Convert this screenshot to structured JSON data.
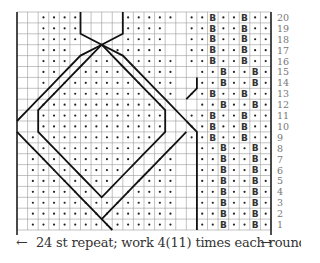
{
  "chart_data": {
    "type": "table",
    "columns": 24,
    "rows": 20,
    "row_labels": [
      "1",
      "2",
      "3",
      "4",
      "5",
      "6",
      "7",
      "8",
      "9",
      "10",
      "11",
      "12",
      "13",
      "14",
      "15",
      "16",
      "17",
      "18",
      "19",
      "20"
    ],
    "legend_symbols": {
      ".": "purl (dot)",
      "B": "knit through back loop",
      "_": "knit (blank)",
      "/": "cable cross stitch marker"
    },
    "grid_top_to_bottom": [
      "__....____....._..B..B..",
      "__....____....__..B..B..",
      "__....____....__..B..B..",
      "__.../__\\.....__..B..B..",
      "__...//..\\\\...._..B..B..",
      "__..//....\\\\...__..B..B..",
      "__./........\\..__..B..B..",
      "__/..........\\._..B..B..",
      "_/............\\__..B..B..",
      "__............__..B..B..",
      "__............__..B..B..",
      "_.\\..........//_..B..B..",
      "_..\\........//.__..B..B..",
      "_...\\......//..__..B..B..",
      "_....\\....//...__..B..B..",
      "_.....\\..//....__..B..B..",
      "_......\\//.....__..B..B..",
      "_..............__..B..B..",
      "_..............__..B..B..",
      "_..............__..B..B.."
    ],
    "footer": {
      "left_arrow": "←",
      "text": "24 st repeat; work 4(11) times each round",
      "right_arrow": "→"
    }
  }
}
